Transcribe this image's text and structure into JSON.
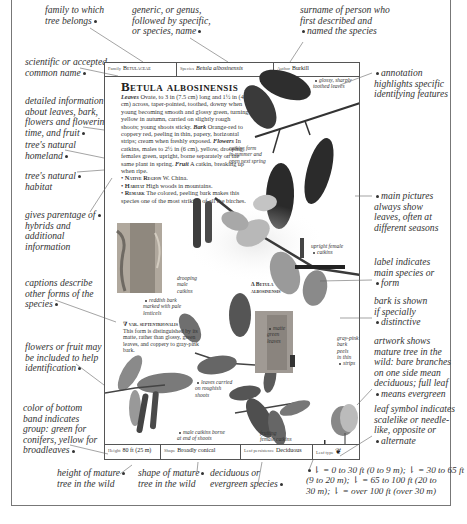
{
  "annotations": {
    "family": [
      "family to which",
      "tree belongs"
    ],
    "genus": [
      "generic, or genus,",
      "followed by specific,",
      "or species, name"
    ],
    "author": [
      "surname of person who",
      "first described and",
      "named the species"
    ],
    "common_name": [
      "scientific or accepted",
      "common name"
    ],
    "detailed_info": [
      "detailed information",
      "about leaves, bark,",
      "flowers and flowering",
      "time, and fruit"
    ],
    "homeland": [
      "tree's natural",
      "homeland"
    ],
    "habitat": [
      "tree's natural",
      "habitat"
    ],
    "parentage": [
      "gives parentage of",
      "hybrids and",
      "additional",
      "information"
    ],
    "captions": [
      "captions describe",
      "other forms of the",
      "species"
    ],
    "flowers": [
      "flowers or fruit may",
      "be included to help",
      "identification"
    ],
    "band_color": [
      "color of bottom",
      "band indicates",
      "group: green for",
      "conifers, yellow for",
      "broadleaves"
    ],
    "height": [
      "height of mature",
      "tree in the wild"
    ],
    "shape": [
      "shape of mature",
      "tree in the wild"
    ],
    "persistence": [
      "deciduous or",
      "evergreen species"
    ],
    "annotation_note": [
      "annotation",
      "highlights specific",
      "identifying features"
    ],
    "main_pictures": [
      "main pictures",
      "always show",
      "leaves, often at",
      "different seasons"
    ],
    "label": [
      "label indicates",
      "main species or",
      "form"
    ],
    "bark": [
      "bark is shown",
      "if specially",
      "distinctive"
    ],
    "artwork": [
      "artwork shows",
      "mature tree in the",
      "wild: bare branches",
      "on one side mean",
      "deciduous; full leaf",
      "means evergreen"
    ],
    "leaf_symbol": [
      "leaf symbol indicates",
      "scalelike or needle-",
      "like, opposite or",
      "alternate"
    ],
    "height_key": [
      "= 0 to 30 ft (0 to 9 m);",
      "= 30 to 65 ft",
      "(9 to 20 m);",
      "= 65 to 100 ft (20 to",
      "30 m);",
      "= over 100 ft (over 30 m)"
    ]
  },
  "page": {
    "top_band": {
      "family_label": "Family",
      "family_value": "Betulaceae",
      "species_label": "Species",
      "species_value": "Betula albosinensis",
      "author_label": "Author",
      "author_value": "Burkill"
    },
    "title": "Betula albosinensis",
    "description": {
      "leaves_label": "Leaves",
      "leaves_text": "Ovate, to 3 in (7.5 cm) long and 1½ in (4 cm) across, taper-pointed, toothed, downy when young becoming smooth and glossy green, turning yellow in autumn, carried on slightly rough shoots; young shoots sticky.",
      "bark_label": "Bark",
      "bark_text": "Orange-red to coppery red, peeling in thin, papery, horizontal strips; cream when freshly exposed.",
      "flowers_label": "Flowers",
      "flowers_text": "In catkins, males to 2½ in (6 cm), yellow, drooping, females green, upright, borne separately on the same plant in spring.",
      "fruit_label": "Fruit",
      "fruit_text": "A catkin, breaking up when ripe.",
      "native_label": "Native Region",
      "native_text": "W. China.",
      "habitat_label": "Habitat",
      "habitat_text": "High woods in mountains.",
      "remark_label": "Remark",
      "remark_text": "The colored, peeling bark makes this species one of the most striking of all the birches."
    },
    "captions": {
      "glossy_leaves": [
        "glossy, sharply",
        "toothed leaves"
      ],
      "catkins_form": [
        "catkins form",
        "in summer and",
        "open next spring"
      ],
      "upright_female": [
        "upright female",
        "catkins"
      ],
      "drooping_male": [
        "drooping",
        "male",
        "catkins"
      ],
      "main_label": [
        "Δ Betula",
        "albosinensis"
      ],
      "reddish_bark": [
        "reddish bark",
        "marked with pale",
        "lenticels"
      ],
      "variety_title": "∇ var. septentrionalis",
      "variety_text": "This form is distinguished by its matte, rather than glossy, green leaves, and coppery to gray-pink bark.",
      "matte_leaves": [
        "matte",
        "green",
        "leaves"
      ],
      "gray_pink_bark": [
        "gray-pink",
        "bark peels",
        "in thin",
        "strips"
      ],
      "rough_shoots": [
        "leaves carried",
        "on roughish",
        "shoots"
      ],
      "male_catkins_end": [
        "male catkins borne",
        "at end of shoots"
      ],
      "fruiting_female": [
        "fruiting",
        "female catkins",
        "borne upright"
      ]
    },
    "bottom_band": {
      "height_label": "Height",
      "height_value": "80 ft (25 m)",
      "shape_label": "Shape",
      "shape_value": "Broadly conical",
      "persistence_label": "Leaf persistence",
      "persistence_value": "Deciduous",
      "leaf_type_label": "Leaf type"
    }
  },
  "colors": {
    "leaf_dark": "#2e2e2e",
    "leaf_mid": "#7a7a7a",
    "leaf_light": "#b8b8b8",
    "catkin": "#3d3d3d",
    "bark_light": "#bdb6ab",
    "bark_dark": "#6f6a63",
    "frame": "#777777"
  }
}
